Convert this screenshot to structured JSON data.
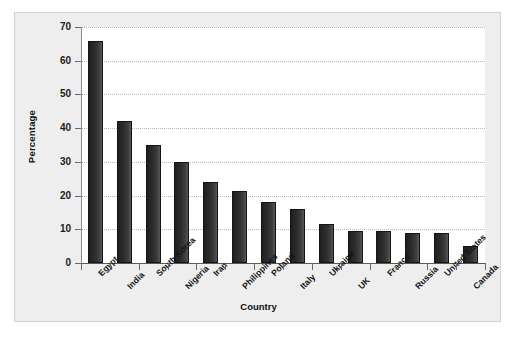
{
  "chart_data": {
    "type": "bar",
    "title": "",
    "subtitle": "",
    "xlabel": "Country",
    "ylabel": "Percentage",
    "ylim": [
      0,
      70
    ],
    "ytick_values": [
      0,
      10,
      20,
      30,
      40,
      50,
      60,
      70
    ],
    "ytick_labels": [
      "0",
      "10",
      "20",
      "30",
      "40",
      "50",
      "60",
      "70"
    ],
    "grid": "horizontal-dotted",
    "legend": "none",
    "bar_color": "#2c2c2c",
    "plot_background": "#ffffff",
    "figure_background": "#eeeeee",
    "categories": [
      "Egypt",
      "India",
      "South Korea",
      "Nigeria",
      "Iran",
      "Philippines",
      "Poland",
      "Italy",
      "Ukraine",
      "UK",
      "France",
      "Russia",
      "United States",
      "Canada"
    ],
    "values": [
      66,
      42,
      35,
      30,
      24,
      21.5,
      18,
      16,
      11.5,
      9.5,
      9.5,
      9,
      9,
      5
    ]
  }
}
